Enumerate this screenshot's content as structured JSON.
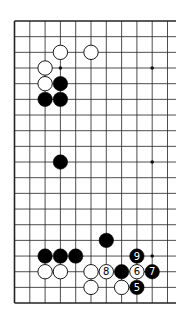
{
  "diagram": {
    "type": "go-board-fragment",
    "board": {
      "rows": 19,
      "visible_columns": 11,
      "right_edge_cut": true,
      "origin_x": 14.5,
      "origin_y": 21,
      "spacing_x": 15.3,
      "spacing_y": 15.67,
      "line_color": "#222222",
      "background": "#ffffff"
    },
    "star_points": [
      {
        "col": 3,
        "row": 3
      },
      {
        "col": 9,
        "row": 3
      },
      {
        "col": 9,
        "row": 9
      },
      {
        "col": 9,
        "row": 15
      }
    ],
    "stones": [
      {
        "col": 3,
        "row": 2,
        "color": "white",
        "label": ""
      },
      {
        "col": 5,
        "row": 2,
        "color": "white",
        "label": ""
      },
      {
        "col": 2,
        "row": 3,
        "color": "white",
        "label": ""
      },
      {
        "col": 2,
        "row": 4,
        "color": "white",
        "label": ""
      },
      {
        "col": 3,
        "row": 4,
        "color": "black",
        "label": ""
      },
      {
        "col": 2,
        "row": 5,
        "color": "black",
        "label": ""
      },
      {
        "col": 3,
        "row": 5,
        "color": "black",
        "label": ""
      },
      {
        "col": 3,
        "row": 9,
        "color": "black",
        "label": ""
      },
      {
        "col": 6,
        "row": 14,
        "color": "black",
        "label": ""
      },
      {
        "col": 2,
        "row": 15,
        "color": "black",
        "label": ""
      },
      {
        "col": 3,
        "row": 15,
        "color": "black",
        "label": ""
      },
      {
        "col": 4,
        "row": 15,
        "color": "black",
        "label": ""
      },
      {
        "col": 8,
        "row": 15,
        "color": "black",
        "label": "9"
      },
      {
        "col": 2,
        "row": 16,
        "color": "white",
        "label": ""
      },
      {
        "col": 3,
        "row": 16,
        "color": "white",
        "label": ""
      },
      {
        "col": 5,
        "row": 16,
        "color": "white",
        "label": ""
      },
      {
        "col": 6,
        "row": 16,
        "color": "white",
        "label": "8"
      },
      {
        "col": 7,
        "row": 16,
        "color": "black",
        "label": ""
      },
      {
        "col": 8,
        "row": 16,
        "color": "white",
        "label": "6"
      },
      {
        "col": 9,
        "row": 16,
        "color": "black",
        "label": "7"
      },
      {
        "col": 5,
        "row": 17,
        "color": "white",
        "label": ""
      },
      {
        "col": 7,
        "row": 17,
        "color": "white",
        "label": ""
      },
      {
        "col": 8,
        "row": 17,
        "color": "black",
        "label": "5"
      }
    ]
  }
}
